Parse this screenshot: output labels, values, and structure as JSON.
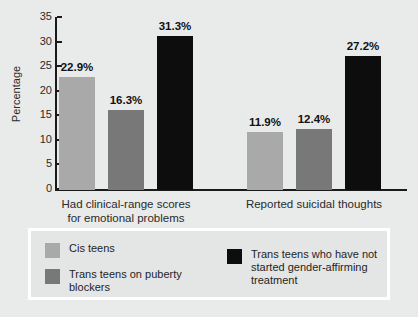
{
  "chart_data": {
    "type": "bar",
    "title": "",
    "xlabel": "",
    "ylabel": "Percentage",
    "ylim": [
      0,
      35
    ],
    "yticks": [
      "0",
      "5",
      "10",
      "15",
      "20",
      "25",
      "30",
      "35"
    ],
    "grid": false,
    "legend_position": "bottom",
    "categories": [
      "Had clinical-range scores\nfor emotional problems",
      "Reported suicidal thoughts"
    ],
    "category_lines": [
      [
        "Had clinical-range scores",
        "for emotional problems"
      ],
      [
        "Reported suicidal thoughts"
      ]
    ],
    "series": [
      {
        "name": "Cis teens",
        "color": "#a9a9a9",
        "values": [
          22.9,
          12.4
        ],
        "labels": [
          "22.9%",
          "11.9%"
        ]
      },
      {
        "name": "Trans teens on puberty blockers",
        "color": "#787878",
        "values": [
          16.3,
          12.4
        ],
        "labels": [
          "16.3%",
          "12.4%"
        ]
      },
      {
        "name": "Trans teens who have not started gender-affirming treatment",
        "color": "#0d0d0d",
        "values": [
          31.3,
          27.2
        ],
        "labels": [
          "31.3%",
          "27.2%"
        ]
      }
    ],
    "bars": [
      {
        "group": 0,
        "series": 0,
        "value": 22.9,
        "label": "22.9%",
        "color": "#a9a9a9"
      },
      {
        "group": 0,
        "series": 1,
        "value": 16.3,
        "label": "16.3%",
        "color": "#787878"
      },
      {
        "group": 0,
        "series": 2,
        "value": 31.3,
        "label": "31.3%",
        "color": "#0d0d0d"
      },
      {
        "group": 1,
        "series": 0,
        "value": 11.9,
        "label": "11.9%",
        "color": "#a9a9a9"
      },
      {
        "group": 1,
        "series": 1,
        "value": 12.4,
        "label": "12.4%",
        "color": "#787878"
      },
      {
        "group": 1,
        "series": 2,
        "value": 27.2,
        "label": "27.2%",
        "color": "#0d0d0d"
      }
    ]
  },
  "axis": {
    "y_title": "Percentage",
    "ticks": [
      "35",
      "30",
      "25",
      "20",
      "15",
      "10",
      "5",
      "0"
    ]
  },
  "legend": {
    "entries": [
      {
        "label": "Cis teens",
        "color": "#a9a9a9"
      },
      {
        "label": "Trans teens on puberty\nblockers",
        "color": "#787878"
      },
      {
        "label": "Trans teens who have not\nstarted gender-affirming\ntreatment",
        "color": "#0d0d0d"
      }
    ]
  },
  "colors": {
    "background": "#e9eaea",
    "axis": "#1a1a1a",
    "text": "#2a2a2a",
    "legend_background": "#e4e5e5",
    "legend_border": "#ffffff"
  }
}
